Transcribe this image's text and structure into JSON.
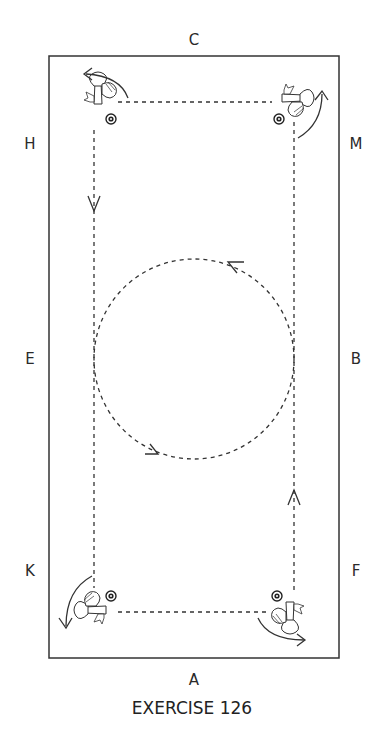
{
  "diagram": {
    "caption": "EXERCISE 126",
    "arena": {
      "x": 49,
      "y": 56,
      "width": 290,
      "height": 602,
      "stroke": "#333333"
    },
    "letters": [
      {
        "id": "C",
        "label": "C",
        "x": 194,
        "y": 40
      },
      {
        "id": "H",
        "label": "H",
        "x": 30,
        "y": 144
      },
      {
        "id": "M",
        "label": "M",
        "x": 356,
        "y": 144
      },
      {
        "id": "E",
        "label": "E",
        "x": 30,
        "y": 359
      },
      {
        "id": "B",
        "label": "B",
        "x": 356,
        "y": 359
      },
      {
        "id": "K",
        "label": "K",
        "x": 30,
        "y": 571
      },
      {
        "id": "F",
        "label": "F",
        "x": 356,
        "y": 571
      },
      {
        "id": "A",
        "label": "A",
        "x": 194,
        "y": 680
      }
    ],
    "track": {
      "type": "dashed-rectangle",
      "left": 94,
      "right": 294,
      "top": 102,
      "bottom": 612,
      "arrows": [
        {
          "where": "left-side",
          "direction": "down",
          "x": 94,
          "y": 203
        },
        {
          "where": "right-side",
          "direction": "up",
          "x": 294,
          "y": 497
        }
      ]
    },
    "circle": {
      "cx": 194,
      "cy": 359,
      "r": 100,
      "direction": "counter-clockwise",
      "arrows": [
        {
          "where": "upper-right",
          "x": 240,
          "y": 263
        },
        {
          "where": "lower-left",
          "x": 152,
          "y": 455
        }
      ]
    },
    "cones": [
      {
        "corner": "top-left",
        "x": 111,
        "y": 119
      },
      {
        "corner": "top-right",
        "x": 279,
        "y": 119
      },
      {
        "corner": "bottom-left",
        "x": 111,
        "y": 596
      },
      {
        "corner": "bottom-right",
        "x": 277,
        "y": 596
      }
    ],
    "horses": [
      {
        "corner": "top-left",
        "x": 100,
        "y": 100,
        "turn": "counter-clockwise"
      },
      {
        "corner": "top-right",
        "x": 290,
        "y": 102,
        "turn": "counter-clockwise"
      },
      {
        "corner": "bottom-left",
        "x": 96,
        "y": 612,
        "turn": "counter-clockwise"
      },
      {
        "corner": "bottom-right",
        "x": 290,
        "y": 612,
        "turn": "counter-clockwise"
      }
    ]
  }
}
